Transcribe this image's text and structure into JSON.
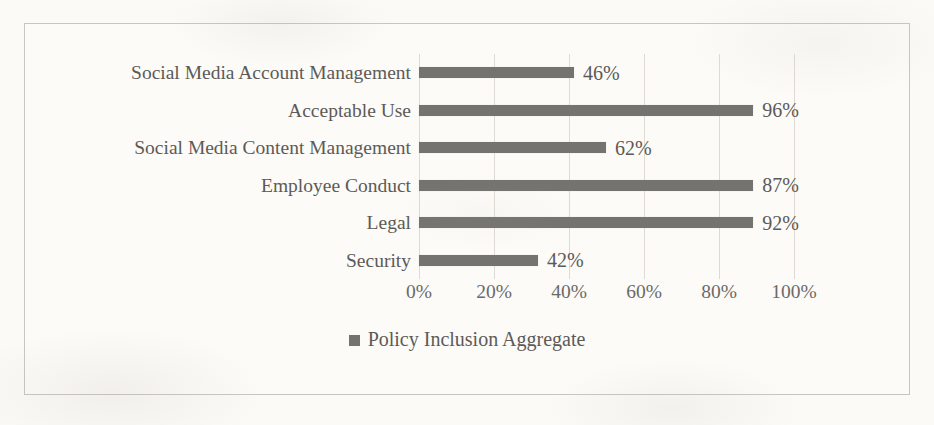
{
  "chart_data": {
    "type": "bar",
    "orientation": "horizontal",
    "title": "",
    "xlabel": "",
    "ylabel": "",
    "xlim": [
      0,
      100
    ],
    "xticks": [
      "0%",
      "20%",
      "40%",
      "60%",
      "80%",
      "100%"
    ],
    "xtick_values": [
      0,
      20,
      40,
      60,
      80,
      100
    ],
    "grid": true,
    "legend": {
      "position": "bottom-center",
      "entries": [
        {
          "name": "Policy Inclusion Aggregate",
          "color": "#75736f",
          "marker": "square"
        }
      ]
    },
    "categories": [
      "Social Media Account Management",
      "Acceptable Use",
      "Social Media Content Management",
      "Employee Conduct",
      "Legal",
      "Security"
    ],
    "series": [
      {
        "name": "Policy Inclusion Aggregate",
        "values": [
          46,
          96,
          62,
          87,
          92,
          42
        ],
        "labels": [
          "46%",
          "96%",
          "62%",
          "87%",
          "92%",
          "42%"
        ],
        "drawn_bar_px": [
          155,
          368,
          187,
          357,
          337,
          119
        ]
      }
    ]
  },
  "colors": {
    "bar": "#75736f",
    "text": "#5c5a57",
    "tick_text": "#6b6966",
    "gridline": "#dedbd4",
    "frame_border": "#c8c6c0",
    "page_background": "#fbfaf7"
  }
}
